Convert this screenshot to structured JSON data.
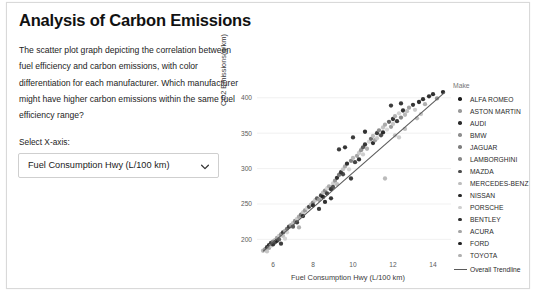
{
  "card": {
    "title": "Analysis of Carbon Emissions",
    "description": "The scatter plot graph depicting the correlation between fuel efficiency and carbon emissions, with color differentiation for each manufacturer. Which manufacturer might have higher carbon emissions within the same fuel efficiency range?",
    "select_label": "Select X-axis:"
  },
  "controls": {
    "xaxis_select": {
      "value": "Fuel Consumption Hwy (L/100 km)",
      "caret_icon": "chevron-down-icon"
    }
  },
  "legend": {
    "title": "Make",
    "trendline_label": "Overall Trendline",
    "trendline_color": "#5a5a5a",
    "entries": [
      {
        "label": "ALFA ROMEO",
        "color": "#1c1c1c"
      },
      {
        "label": "ASTON MARTIN",
        "color": "#9a9a9a"
      },
      {
        "label": "AUDI",
        "color": "#2b2b2b"
      },
      {
        "label": "BMW",
        "color": "#8e8e8e"
      },
      {
        "label": "JAGUAR",
        "color": "#7e7e7e"
      },
      {
        "label": "LAMBORGHINI",
        "color": "#888888"
      },
      {
        "label": "MAZDA",
        "color": "#4a4a4a"
      },
      {
        "label": "MERCEDES-BENZ",
        "color": "#bdbdbd"
      },
      {
        "label": "NISSAN",
        "color": "#262626"
      },
      {
        "label": "PORSCHE",
        "color": "#cfcfcf"
      },
      {
        "label": "BENTLEY",
        "color": "#303030"
      },
      {
        "label": "ACURA",
        "color": "#a5a5a5"
      },
      {
        "label": "FORD",
        "color": "#222222"
      },
      {
        "label": "TOYOTA",
        "color": "#b0b0b0"
      }
    ]
  },
  "bottom_strip": {
    "text": ""
  },
  "chart_data": {
    "type": "scatter",
    "title": "",
    "xlabel": "Fuel Consumption Hwy (L/100 km)",
    "ylabel": "CO2 Emissions(g/km)",
    "xlim": [
      5.2,
      14.9
    ],
    "ylim": [
      178,
      418
    ],
    "xticks": [
      6,
      8,
      10,
      12,
      14
    ],
    "yticks": [
      200,
      250,
      300,
      350,
      400
    ],
    "grid": true,
    "legend_position": "right",
    "color_by": "Make",
    "trendline": {
      "label": "Overall Trendline",
      "color": "#5a5a5a",
      "x": [
        5.5,
        14.6
      ],
      "y": [
        183,
        408
      ]
    },
    "points": [
      {
        "x": 5.5,
        "y": 184,
        "c": "#b6b6b6"
      },
      {
        "x": 5.6,
        "y": 186,
        "c": "#8f8f8f"
      },
      {
        "x": 5.7,
        "y": 189,
        "c": "#2a2a2a"
      },
      {
        "x": 5.7,
        "y": 183,
        "c": "#c2c2c2"
      },
      {
        "x": 5.8,
        "y": 192,
        "c": "#1f1f1f"
      },
      {
        "x": 5.8,
        "y": 188,
        "c": "#a0a0a0"
      },
      {
        "x": 5.9,
        "y": 195,
        "c": "#333333"
      },
      {
        "x": 5.9,
        "y": 191,
        "c": "#cbcbcb"
      },
      {
        "x": 6.0,
        "y": 197,
        "c": "#7a7a7a"
      },
      {
        "x": 6.0,
        "y": 193,
        "c": "#262626"
      },
      {
        "x": 6.1,
        "y": 199,
        "c": "#b0b0b0"
      },
      {
        "x": 6.1,
        "y": 196,
        "c": "#414141"
      },
      {
        "x": 6.2,
        "y": 202,
        "c": "#9c9c9c"
      },
      {
        "x": 6.2,
        "y": 198,
        "c": "#1b1b1b"
      },
      {
        "x": 6.3,
        "y": 205,
        "c": "#c7c7c7"
      },
      {
        "x": 6.3,
        "y": 200,
        "c": "#555555"
      },
      {
        "x": 6.4,
        "y": 207,
        "c": "#8a8a8a"
      },
      {
        "x": 6.5,
        "y": 210,
        "c": "#2f2f2f"
      },
      {
        "x": 6.5,
        "y": 205,
        "c": "#bdbdbd"
      },
      {
        "x": 6.6,
        "y": 212,
        "c": "#a8a8a8"
      },
      {
        "x": 6.7,
        "y": 215,
        "c": "#6e6e6e"
      },
      {
        "x": 6.7,
        "y": 210,
        "c": "#d2d2d2"
      },
      {
        "x": 6.8,
        "y": 218,
        "c": "#353535"
      },
      {
        "x": 6.9,
        "y": 220,
        "c": "#9e9e9e"
      },
      {
        "x": 7.0,
        "y": 223,
        "c": "#bbbbbb"
      },
      {
        "x": 7.0,
        "y": 218,
        "c": "#4b4b4b"
      },
      {
        "x": 7.1,
        "y": 226,
        "c": "#888888"
      },
      {
        "x": 7.2,
        "y": 229,
        "c": "#c9c9c9"
      },
      {
        "x": 7.2,
        "y": 224,
        "c": "#2d2d2d"
      },
      {
        "x": 7.3,
        "y": 232,
        "c": "#a3a3a3"
      },
      {
        "x": 7.4,
        "y": 235,
        "c": "#6a6a6a"
      },
      {
        "x": 7.5,
        "y": 238,
        "c": "#bfbfbf"
      },
      {
        "x": 7.5,
        "y": 233,
        "c": "#232323"
      },
      {
        "x": 7.6,
        "y": 241,
        "c": "#949494"
      },
      {
        "x": 7.7,
        "y": 244,
        "c": "#d0d0d0"
      },
      {
        "x": 7.8,
        "y": 246,
        "c": "#3b3b3b"
      },
      {
        "x": 7.9,
        "y": 249,
        "c": "#aeaeae"
      },
      {
        "x": 8.0,
        "y": 252,
        "c": "#7f7f7f"
      },
      {
        "x": 8.0,
        "y": 248,
        "c": "#1e1e1e"
      },
      {
        "x": 8.1,
        "y": 255,
        "c": "#c4c4c4"
      },
      {
        "x": 8.2,
        "y": 258,
        "c": "#515151"
      },
      {
        "x": 8.3,
        "y": 256,
        "c": "#9a9a9a"
      },
      {
        "x": 8.4,
        "y": 262,
        "c": "#2c2c2c"
      },
      {
        "x": 8.5,
        "y": 266,
        "c": "#b8b8b8"
      },
      {
        "x": 8.5,
        "y": 260,
        "c": "#1a1a1a"
      },
      {
        "x": 8.6,
        "y": 269,
        "c": "#868686"
      },
      {
        "x": 8.7,
        "y": 272,
        "c": "#d4d4d4"
      },
      {
        "x": 8.7,
        "y": 265,
        "c": "#303030"
      },
      {
        "x": 8.8,
        "y": 275,
        "c": "#a6a6a6"
      },
      {
        "x": 8.9,
        "y": 271,
        "c": "#252525"
      },
      {
        "x": 9.0,
        "y": 279,
        "c": "#cdcdcd"
      },
      {
        "x": 9.0,
        "y": 274,
        "c": "#444444"
      },
      {
        "x": 9.1,
        "y": 283,
        "c": "#909090"
      },
      {
        "x": 9.2,
        "y": 287,
        "c": "#1f1f1f"
      },
      {
        "x": 9.2,
        "y": 278,
        "c": "#bcbcbc"
      },
      {
        "x": 9.3,
        "y": 291,
        "c": "#6f6f6f"
      },
      {
        "x": 9.4,
        "y": 295,
        "c": "#282828"
      },
      {
        "x": 9.5,
        "y": 299,
        "c": "#c0c0c0"
      },
      {
        "x": 9.5,
        "y": 292,
        "c": "#3a3a3a"
      },
      {
        "x": 9.6,
        "y": 303,
        "c": "#a2a2a2"
      },
      {
        "x": 9.7,
        "y": 307,
        "c": "#1d1d1d"
      },
      {
        "x": 9.8,
        "y": 299,
        "c": "#d1d1d1"
      },
      {
        "x": 9.9,
        "y": 311,
        "c": "#7b7b7b"
      },
      {
        "x": 9.9,
        "y": 286,
        "c": "#2b2b2b"
      },
      {
        "x": 10.0,
        "y": 315,
        "c": "#b4b4b4"
      },
      {
        "x": 10.1,
        "y": 309,
        "c": "#343434"
      },
      {
        "x": 10.2,
        "y": 318,
        "c": "#9d9d9d"
      },
      {
        "x": 10.3,
        "y": 322,
        "c": "#c6c6c6"
      },
      {
        "x": 10.3,
        "y": 313,
        "c": "#212121"
      },
      {
        "x": 10.4,
        "y": 326,
        "c": "#8c8c8c"
      },
      {
        "x": 10.5,
        "y": 330,
        "c": "#4e4e4e"
      },
      {
        "x": 10.5,
        "y": 320,
        "c": "#cbcbcb"
      },
      {
        "x": 10.6,
        "y": 334,
        "c": "#262626"
      },
      {
        "x": 10.7,
        "y": 328,
        "c": "#aaaaaa"
      },
      {
        "x": 10.8,
        "y": 338,
        "c": "#d3d3d3"
      },
      {
        "x": 10.9,
        "y": 342,
        "c": "#636363"
      },
      {
        "x": 11.0,
        "y": 336,
        "c": "#1c1c1c"
      },
      {
        "x": 11.0,
        "y": 346,
        "c": "#b9b9b9"
      },
      {
        "x": 11.1,
        "y": 340,
        "c": "#9b9b9b"
      },
      {
        "x": 11.2,
        "y": 350,
        "c": "#2e2e2e"
      },
      {
        "x": 11.2,
        "y": 343,
        "c": "#c8c8c8"
      },
      {
        "x": 11.3,
        "y": 354,
        "c": "#848484"
      },
      {
        "x": 11.4,
        "y": 347,
        "c": "#3d3d3d"
      },
      {
        "x": 11.5,
        "y": 358,
        "c": "#bebebe"
      },
      {
        "x": 11.5,
        "y": 351,
        "c": "#191919"
      },
      {
        "x": 11.6,
        "y": 362,
        "c": "#a4a4a4"
      },
      {
        "x": 11.7,
        "y": 355,
        "c": "#d6d6d6"
      },
      {
        "x": 11.8,
        "y": 366,
        "c": "#545454"
      },
      {
        "x": 11.9,
        "y": 359,
        "c": "#959595"
      },
      {
        "x": 12.0,
        "y": 370,
        "c": "#232323"
      },
      {
        "x": 12.0,
        "y": 363,
        "c": "#c2c2c2"
      },
      {
        "x": 12.1,
        "y": 374,
        "c": "#ababab"
      },
      {
        "x": 12.2,
        "y": 367,
        "c": "#2a2a2a"
      },
      {
        "x": 12.3,
        "y": 378,
        "c": "#cecece"
      },
      {
        "x": 12.4,
        "y": 372,
        "c": "#7d7d7d"
      },
      {
        "x": 12.5,
        "y": 382,
        "c": "#1e1e1e"
      },
      {
        "x": 12.6,
        "y": 376,
        "c": "#b2b2b2"
      },
      {
        "x": 12.8,
        "y": 386,
        "c": "#999999"
      },
      {
        "x": 13.0,
        "y": 390,
        "c": "#242424"
      },
      {
        "x": 13.1,
        "y": 383,
        "c": "#c5c5c5"
      },
      {
        "x": 13.3,
        "y": 394,
        "c": "#1b1b1b"
      },
      {
        "x": 13.5,
        "y": 398,
        "c": "#222222"
      },
      {
        "x": 13.6,
        "y": 391,
        "c": "#a7a7a7"
      },
      {
        "x": 13.8,
        "y": 402,
        "c": "#1d1d1d"
      },
      {
        "x": 14.0,
        "y": 405,
        "c": "#202020"
      },
      {
        "x": 14.2,
        "y": 399,
        "c": "#8b8b8b"
      },
      {
        "x": 14.5,
        "y": 408,
        "c": "#181818"
      },
      {
        "x": 11.9,
        "y": 389,
        "c": "#2b2b2b"
      },
      {
        "x": 12.4,
        "y": 392,
        "c": "#262626"
      },
      {
        "x": 12.7,
        "y": 381,
        "c": "#bbbbbb"
      },
      {
        "x": 10.6,
        "y": 352,
        "c": "#1f1f1f"
      },
      {
        "x": 10.0,
        "y": 344,
        "c": "#2a2a2a"
      },
      {
        "x": 9.6,
        "y": 330,
        "c": "#242424"
      },
      {
        "x": 9.3,
        "y": 327,
        "c": "#2d2d2d"
      },
      {
        "x": 11.6,
        "y": 286,
        "c": "#b5b5b5"
      },
      {
        "x": 12.1,
        "y": 347,
        "c": "#c1c1c1"
      },
      {
        "x": 12.3,
        "y": 344,
        "c": "#cacaca"
      },
      {
        "x": 12.6,
        "y": 356,
        "c": "#bdbdbd"
      },
      {
        "x": 13.2,
        "y": 371,
        "c": "#b7b7b7"
      },
      {
        "x": 13.4,
        "y": 377,
        "c": "#c3c3c3"
      },
      {
        "x": 8.3,
        "y": 243,
        "c": "#2b2b2b"
      },
      {
        "x": 8.6,
        "y": 253,
        "c": "#1f1f1f"
      },
      {
        "x": 8.9,
        "y": 258,
        "c": "#252525"
      },
      {
        "x": 7.3,
        "y": 217,
        "c": "#aaaaaa"
      },
      {
        "x": 6.6,
        "y": 201,
        "c": "#d0d0d0"
      },
      {
        "x": 6.4,
        "y": 194,
        "c": "#2d2d2d"
      }
    ]
  }
}
